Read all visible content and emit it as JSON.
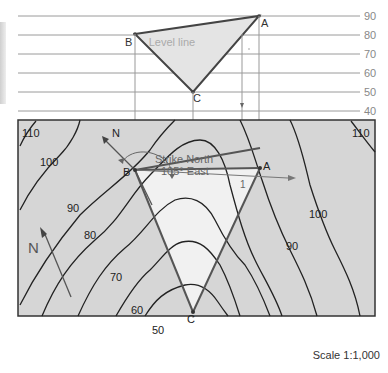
{
  "section": {
    "elevation_levels": [
      "90",
      "80",
      "70",
      "60",
      "50",
      "40"
    ],
    "label_level_line": "Level line",
    "points": {
      "A": "A",
      "B": "B",
      "C": "C"
    }
  },
  "map": {
    "contour_labels": {
      "c110_left": "110",
      "c110_right": "110",
      "c100_left": "100",
      "c100_right": "100",
      "c90_left": "90",
      "c90_right": "90",
      "c80": "80",
      "c70": "70",
      "c60": "60",
      "c50": "50"
    },
    "points": {
      "A": "A",
      "B": "B",
      "C": "C"
    },
    "north_label": "N",
    "north_arrow_label": "N",
    "strike_line1": "Strike North",
    "strike_line2": "105° East",
    "dip_marker": "1"
  },
  "footer": {
    "scale": "Scale 1:1,000"
  },
  "colors": {
    "map_fill": "#d6d6d6",
    "triangle_fill": "#f2f2f2",
    "section_fill": "#e4e4e4",
    "line": "#444444",
    "level_line": "#999999"
  }
}
